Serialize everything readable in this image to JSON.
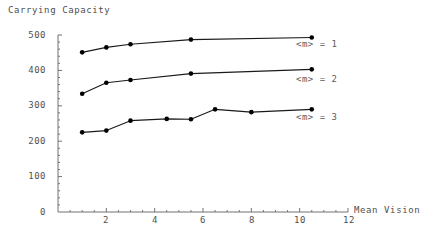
{
  "chart_data": {
    "type": "line",
    "title": "",
    "ylabel": "Carrying Capacity",
    "xlabel": "Mean Vision",
    "xlim": [
      0,
      12
    ],
    "ylim": [
      0,
      500
    ],
    "grid": false,
    "legend_position": "inline-right",
    "xticks": [
      2,
      4,
      6,
      8,
      10,
      12
    ],
    "xtick_labels": [
      "2",
      "4",
      "6",
      "8",
      "10",
      "12"
    ],
    "yticks": [
      0,
      100,
      200,
      300,
      400,
      500
    ],
    "ytick_labels": [
      "0",
      "100",
      "200",
      "300",
      "400",
      "500"
    ],
    "x_origin_label": "0",
    "marker": "filled-circle",
    "series": [
      {
        "name": "<m> = 1",
        "annotation": "<m> = 1",
        "x": [
          1.0,
          2.0,
          3.0,
          5.5,
          10.5
        ],
        "values": [
          451,
          465,
          474,
          487,
          493
        ]
      },
      {
        "name": "<m> = 2",
        "annotation": "<m> = 2",
        "x": [
          1.0,
          2.0,
          3.0,
          5.5,
          10.5
        ],
        "values": [
          334,
          365,
          373,
          391,
          403
        ]
      },
      {
        "name": "<m> = 3",
        "annotation": "<m> = 3",
        "x": [
          1.0,
          2.0,
          3.0,
          4.5,
          5.5,
          6.5,
          8.0,
          10.5
        ],
        "values": [
          225,
          230,
          258,
          263,
          262,
          290,
          282,
          290
        ]
      }
    ],
    "annotations": [
      {
        "text": "<m> = 1",
        "x": 9.0,
        "y": 435
      },
      {
        "text": "<m> = 2",
        "x": 9.0,
        "y": 337
      },
      {
        "text": "<m> = 3",
        "x": 9.0,
        "y": 232
      }
    ],
    "colors": {
      "line": "#1a1a1a",
      "marker": "#000000",
      "axis": "#737373",
      "text": "#4f4f4f",
      "background": "#ffffff"
    }
  }
}
